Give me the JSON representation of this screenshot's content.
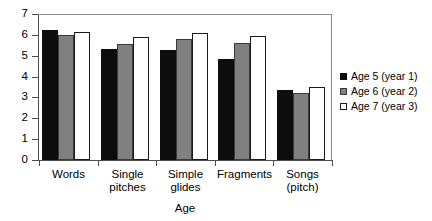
{
  "chart_data": {
    "type": "bar",
    "title": "",
    "xlabel": "Age",
    "ylabel": "",
    "ylim": [
      0,
      7
    ],
    "yticks": [
      0,
      1,
      2,
      3,
      4,
      5,
      6,
      7
    ],
    "ytick_labels": [
      "0",
      "1",
      "2",
      "3",
      "4",
      "5",
      "6",
      "7"
    ],
    "grid": false,
    "legend_position": "right",
    "categories": [
      "Words",
      "Single\npitches",
      "Simple\nglides",
      "Fragments",
      "Songs\n(pitch)"
    ],
    "series": [
      {
        "name": "Age 5 (year 1)",
        "color": "#0d0d0d",
        "values": [
          6.25,
          5.3,
          5.27,
          4.85,
          3.35
        ]
      },
      {
        "name": "Age 6 (year 2)",
        "color": "#808080",
        "values": [
          5.97,
          5.55,
          5.8,
          5.6,
          3.2
        ]
      },
      {
        "name": "Age 7 (year 3)",
        "color": "#ffffff",
        "values": [
          6.15,
          5.9,
          6.1,
          5.95,
          3.5
        ]
      }
    ]
  }
}
